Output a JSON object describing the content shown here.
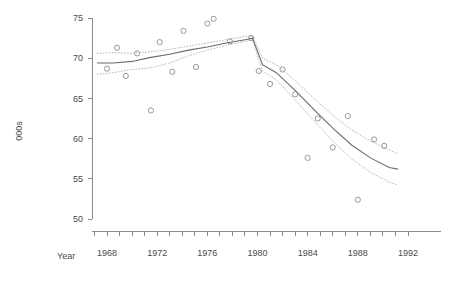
{
  "chart_data": {
    "type": "scatter",
    "title": "",
    "xlabel": "Year",
    "ylabel": "000s",
    "xlim": [
      1966.5,
      1992.8
    ],
    "ylim": [
      50,
      75
    ],
    "grid": false,
    "legend": "none",
    "xticks": [
      1967,
      1968,
      1969,
      1970,
      1971,
      1972,
      1973,
      1974,
      1975,
      1976,
      1977,
      1978,
      1979,
      1980,
      1981,
      1982,
      1983,
      1984,
      1985,
      1986,
      1987,
      1988,
      1989,
      1990,
      1991,
      1992
    ],
    "xticklabels": [
      "1968",
      "1972",
      "1976",
      "1980",
      "1984",
      "1988",
      "1992"
    ],
    "xticklabel_values": [
      1968,
      1972,
      1976,
      1980,
      1984,
      1988,
      1992
    ],
    "yticks": [
      50,
      55,
      60,
      65,
      70,
      75
    ],
    "yticklabels": [
      "50",
      "55",
      "60",
      "65",
      "70",
      "75"
    ],
    "points": {
      "x": [
        1968,
        1968.8,
        1969.5,
        1970.4,
        1971.5,
        1972.2,
        1973.2,
        1974.1,
        1975.1,
        1976.0,
        1976.5,
        1977.8,
        1979.5,
        1980.1,
        1981.0,
        1982.0,
        1983.0,
        1984.0,
        1984.8,
        1986.0,
        1987.2,
        1988.0,
        1989.3,
        1990.1
      ],
      "y": [
        68.7,
        71.3,
        67.8,
        70.6,
        63.5,
        72.0,
        68.3,
        73.4,
        68.9,
        74.3,
        74.9,
        72.1,
        72.5,
        68.4,
        66.8,
        68.6,
        65.5,
        57.6,
        62.5,
        58.9,
        62.8,
        52.4,
        59.9,
        59.1
      ],
      "marker": "open-circle"
    },
    "fit": {
      "name": "fitted-trend",
      "x": [
        1967.2,
        1968.5,
        1970.0,
        1971.5,
        1973.0,
        1974.5,
        1976.0,
        1977.5,
        1979.0,
        1979.6,
        1980.4,
        1981.5,
        1983.0,
        1984.5,
        1986.0,
        1987.5,
        1989.0,
        1990.5,
        1991.2
      ],
      "y": [
        69.4,
        69.4,
        69.6,
        70.1,
        70.5,
        71.0,
        71.4,
        71.9,
        72.3,
        72.5,
        69.2,
        68.2,
        66.0,
        63.6,
        61.3,
        59.2,
        57.6,
        56.4,
        56.2
      ]
    },
    "upper_band": {
      "name": "upper-confidence-band",
      "x": [
        1967.2,
        1968.5,
        1970.0,
        1971.5,
        1973.0,
        1974.5,
        1976.0,
        1977.5,
        1979.0,
        1979.6,
        1980.4,
        1981.5,
        1983.0,
        1984.5,
        1986.0,
        1987.5,
        1989.0,
        1990.5,
        1991.2
      ],
      "y": [
        70.6,
        70.7,
        70.6,
        70.8,
        71.1,
        71.5,
        71.9,
        72.3,
        72.7,
        72.8,
        70.0,
        69.2,
        67.2,
        65.0,
        62.9,
        61.1,
        59.7,
        58.6,
        58.1
      ]
    },
    "lower_band": {
      "name": "lower-confidence-band",
      "x": [
        1967.2,
        1968.5,
        1970.0,
        1971.5,
        1973.0,
        1974.5,
        1976.0,
        1977.5,
        1979.0,
        1979.6,
        1980.4,
        1981.5,
        1983.0,
        1984.5,
        1986.0,
        1987.5,
        1989.0,
        1990.5,
        1991.2
      ],
      "y": [
        68.0,
        68.2,
        68.6,
        68.8,
        69.4,
        70.3,
        71.0,
        71.6,
        72.1,
        72.3,
        68.4,
        67.3,
        64.8,
        62.2,
        59.7,
        57.5,
        55.8,
        54.6,
        54.2
      ]
    }
  },
  "axes": {
    "y_title": "000s",
    "x_title": "Year"
  }
}
